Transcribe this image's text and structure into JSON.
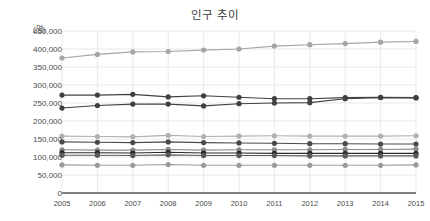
{
  "chart_data": {
    "type": "line",
    "title": "인구 추이",
    "xlabel": "",
    "ylabel": "(명)",
    "yunit": "(명)",
    "categories": [
      "2005",
      "2006",
      "2007",
      "2008",
      "2009",
      "2010",
      "2011",
      "2012",
      "2013",
      "2014",
      "2015"
    ],
    "x": [
      2005,
      2006,
      2007,
      2008,
      2009,
      2010,
      2011,
      2012,
      2013,
      2014,
      2015
    ],
    "ylim": [
      0,
      450000
    ],
    "ytick_values": [
      0,
      50000,
      100000,
      150000,
      200000,
      250000,
      300000,
      350000,
      400000,
      450000
    ],
    "ytick_labels": [
      "0",
      "50,000",
      "100,000",
      "150,000",
      "200,000",
      "250,000",
      "300,000",
      "350,000",
      "400,000",
      "450,000"
    ],
    "grid": true,
    "legend": "none",
    "marker": "circle",
    "series": [
      {
        "name": "series-1",
        "color": "#a6a6a6",
        "values": [
          375000,
          385000,
          392000,
          393000,
          397000,
          400000,
          408000,
          412000,
          415000,
          419000,
          421000
        ]
      },
      {
        "name": "series-2",
        "color": "#404040",
        "values": [
          272000,
          272000,
          274000,
          267000,
          270000,
          266000,
          262000,
          262000,
          265000,
          266000,
          265000
        ]
      },
      {
        "name": "series-3",
        "color": "#404040",
        "values": [
          236000,
          243000,
          247000,
          247000,
          242000,
          248000,
          250000,
          251000,
          262000,
          265000,
          264000
        ]
      },
      {
        "name": "series-4",
        "color": "#b0b0b0",
        "values": [
          158000,
          157000,
          156000,
          160000,
          157000,
          158000,
          159000,
          158000,
          158000,
          158000,
          159000
        ]
      },
      {
        "name": "series-5",
        "color": "#4a4a4a",
        "values": [
          142000,
          141000,
          140000,
          142000,
          140000,
          139000,
          138000,
          137000,
          137000,
          136000,
          136000
        ]
      },
      {
        "name": "series-6",
        "color": "#8a8a8a",
        "values": [
          120000,
          119000,
          119000,
          121000,
          119000,
          120000,
          120000,
          120000,
          121000,
          121000,
          122000
        ]
      },
      {
        "name": "series-7",
        "color": "#2b2b2b",
        "values": [
          112000,
          112000,
          111000,
          113000,
          111000,
          111000,
          110000,
          110000,
          110000,
          110000,
          110000
        ]
      },
      {
        "name": "series-8",
        "color": "#5a5a5a",
        "values": [
          105000,
          105000,
          104000,
          106000,
          104000,
          104000,
          104000,
          103000,
          103000,
          103000,
          103000
        ]
      },
      {
        "name": "series-9",
        "color": "#9a9a9a",
        "values": [
          78000,
          77000,
          77000,
          79000,
          77000,
          77000,
          77000,
          77000,
          77000,
          77000,
          78000
        ]
      }
    ]
  },
  "colors": {
    "background": "#ffffff",
    "gridline": "#e3e3e3",
    "axis": "#595959",
    "text": "#4a4a4a",
    "title": "#404040"
  }
}
